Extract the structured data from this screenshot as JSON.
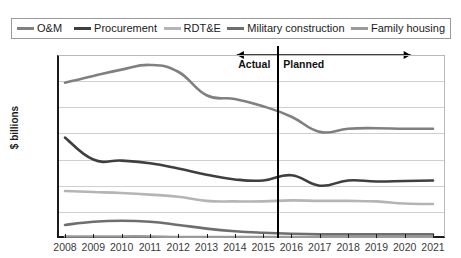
{
  "chart_data": {
    "type": "line",
    "title": "",
    "xlabel": "",
    "ylabel": "$ billions",
    "categories": [
      "2008",
      "2009",
      "2010",
      "2011",
      "2012",
      "2013",
      "2014",
      "2015",
      "2016",
      "2017",
      "2018",
      "2019",
      "2020",
      "2021"
    ],
    "ylim": [
      0,
      350
    ],
    "ytick_step": 50,
    "yticks": [
      "350",
      "300",
      "250",
      "200",
      "150",
      "100",
      "50",
      "0"
    ],
    "grid": true,
    "legend_position": "top",
    "series": [
      {
        "name": "O&M",
        "color": "#808080",
        "values": [
          297,
          310,
          322,
          331,
          318,
          273,
          266,
          252,
          232,
          203,
          209,
          210,
          209,
          209
        ]
      },
      {
        "name": "Procurement",
        "color": "#3f3f3f",
        "values": [
          192,
          150,
          148,
          143,
          133,
          121,
          112,
          110,
          120,
          100,
          110,
          108,
          109,
          110
        ]
      },
      {
        "name": "RDT&E",
        "color": "#b5b5b5",
        "values": [
          90,
          88,
          86,
          83,
          79,
          71,
          70,
          70,
          72,
          71,
          71,
          70,
          66,
          65
        ]
      },
      {
        "name": "Military construction",
        "color": "#6e6e6e",
        "values": [
          25,
          31,
          33,
          31,
          25,
          18,
          13,
          10,
          8,
          7,
          7,
          7,
          7,
          7
        ]
      },
      {
        "name": "Family housing",
        "color": "#9a9a9a",
        "values": [
          3,
          3,
          3,
          3,
          2,
          2,
          2,
          2,
          2,
          2,
          2,
          2,
          2,
          2
        ]
      }
    ],
    "annotations": [
      {
        "name": "actual",
        "label": "Actual",
        "span": [
          "2008",
          "2015"
        ]
      },
      {
        "name": "planned",
        "label": "Planned",
        "span": [
          "2016",
          "2021"
        ]
      }
    ],
    "divider_after_category": "2015"
  }
}
